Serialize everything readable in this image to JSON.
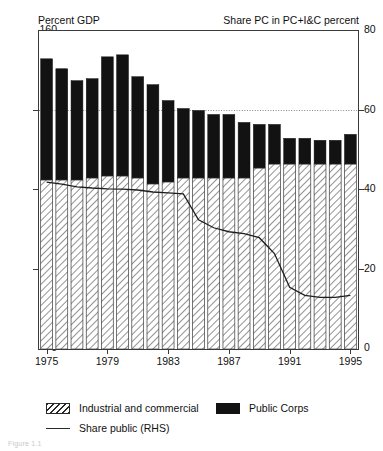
{
  "header": {
    "left_label": "Percent GDP",
    "right_label": "Share PC in PC+I&C percent"
  },
  "legend": {
    "items": [
      {
        "id": "industrial-and-commercial",
        "label": "Industrial and commercial",
        "swatch": "hatch-pattern-icon",
        "color": "#ffffff"
      },
      {
        "id": "public-corps",
        "label": "Public Corps",
        "swatch": "solid-black-icon",
        "color": "#121212"
      },
      {
        "id": "share-public-rhs",
        "label": "Share public (RHS)",
        "swatch": "line-icon",
        "color": "#2a2a2a"
      }
    ]
  },
  "footnote": "Figure 1.1",
  "chart_data": {
    "type": "bar",
    "title": "",
    "subtitle": "",
    "xlabel": "",
    "ylabel": "Percent GDP",
    "y2label": "Share PC in PC+I&C percent",
    "ylim": [
      0,
      160
    ],
    "y2lim": [
      0,
      80
    ],
    "yticks": [
      0,
      40,
      80,
      120,
      160
    ],
    "y2ticks": [
      0,
      20,
      40,
      60,
      80
    ],
    "grid": "dotted gridline at y=120 (left) / 60 (right)",
    "gridline_value": 120,
    "legend_position": "below-plot",
    "stacked": true,
    "x": [
      1975,
      1976,
      1977,
      1978,
      1979,
      1980,
      1981,
      1982,
      1983,
      1984,
      1985,
      1986,
      1987,
      1988,
      1989,
      1990,
      1991,
      1992,
      1993,
      1994,
      1995
    ],
    "xticks": [
      1975,
      1979,
      1983,
      1987,
      1991,
      1995
    ],
    "xticklabels": [
      "1975",
      "1979",
      "1983",
      "1987",
      "1991",
      "1995"
    ],
    "series": [
      {
        "name": "Industrial and commercial",
        "axis": "left",
        "fill": "hatch",
        "values": [
          85,
          85,
          85,
          86,
          87,
          87,
          86,
          83,
          84,
          86,
          86,
          86,
          86,
          86,
          91,
          93,
          93,
          93,
          93,
          93,
          93
        ]
      },
      {
        "name": "Public Corps",
        "axis": "left",
        "fill": "solid",
        "values": [
          61,
          56,
          50,
          50,
          60,
          61,
          51,
          50,
          41,
          35,
          34,
          32,
          32,
          28,
          22,
          20,
          13,
          13,
          12,
          12,
          15
        ]
      },
      {
        "name": "Total (PC + I&C)",
        "axis": "left",
        "fill": "none",
        "values": [
          146,
          141,
          135,
          136,
          147,
          148,
          137,
          133,
          125,
          121,
          120,
          118,
          118,
          114,
          113,
          113,
          106,
          106,
          105,
          105,
          108
        ]
      }
    ],
    "line_series": {
      "name": "Share public (RHS)",
      "axis": "right",
      "values": [
        42,
        41.5,
        40.8,
        40.5,
        40.3,
        40.2,
        40.0,
        39.5,
        39.3,
        39.0,
        32.5,
        30.5,
        29.5,
        29.0,
        28.0,
        24.0,
        15.5,
        13.5,
        13.0,
        13.0,
        13.5
      ]
    }
  }
}
